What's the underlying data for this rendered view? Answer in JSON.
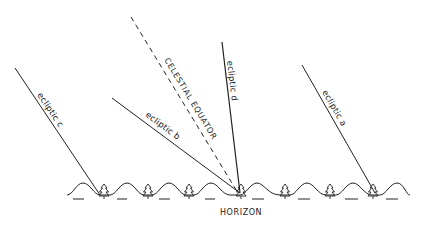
{
  "diagram": {
    "type": "sky-lines-over-horizon",
    "colors": {
      "ink": "#222222",
      "background": "#ffffff"
    },
    "lines": [
      {
        "id": "ecliptic-c",
        "label": "ecliptic c",
        "style": "solid",
        "from": [
          15,
          68
        ],
        "to": [
          100,
          195
        ]
      },
      {
        "id": "ecliptic-b",
        "label": "ecliptic b",
        "style": "solid",
        "from": [
          112,
          98
        ],
        "to": [
          240,
          193
        ]
      },
      {
        "id": "celestial-equator",
        "label": "CELESTIAL EQUATOR",
        "style": "dashed",
        "from": [
          131,
          17
        ],
        "to": [
          238,
          193
        ]
      },
      {
        "id": "ecliptic-d",
        "label": "ecliptic d",
        "style": "solid",
        "from": [
          222,
          42
        ],
        "to": [
          240,
          193
        ]
      },
      {
        "id": "ecliptic-a",
        "label": "ecliptic a",
        "style": "solid",
        "from": [
          302,
          65
        ],
        "to": [
          375,
          193
        ]
      }
    ],
    "horizon": {
      "label": "HORIZON",
      "y": 195,
      "x_start": 67,
      "x_end": 408,
      "trees_x": [
        104,
        147,
        188,
        234,
        284,
        330,
        375
      ],
      "dashes_x": [
        78,
        121,
        165,
        210,
        260,
        305,
        352,
        392
      ]
    }
  }
}
